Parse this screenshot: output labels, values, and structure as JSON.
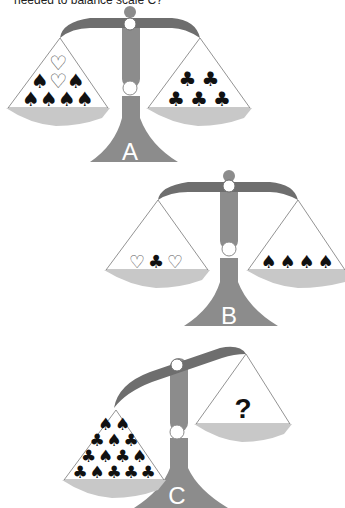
{
  "question": {
    "text": "needed to balance scale C?"
  },
  "colors": {
    "beam": "#6e6e6e",
    "column": "#8c8c8c",
    "pan": "#c8c8c8",
    "pivot": "#ffffff",
    "suit_dark": "#111111",
    "heart_outline": "#555555"
  },
  "scales": [
    {
      "label": "A",
      "left_pan": {
        "rows": [
          [
            "heart"
          ],
          [
            "spade",
            "heart",
            "spade"
          ],
          [
            "spade",
            "spade",
            "spade",
            "spade"
          ]
        ]
      },
      "right_pan": {
        "rows": [
          [
            "club",
            "club"
          ],
          [
            "club",
            "club",
            "club"
          ]
        ]
      }
    },
    {
      "label": "B",
      "left_pan": {
        "rows": [
          [
            "heart",
            "club",
            "heart"
          ]
        ]
      },
      "right_pan": {
        "rows": [
          [
            "spade",
            "spade",
            "spade",
            "spade"
          ]
        ]
      }
    },
    {
      "label": "C",
      "left_pan": {
        "rows": [
          [
            "spade",
            "spade"
          ],
          [
            "club",
            "spade",
            "club"
          ],
          [
            "club",
            "spade",
            "club",
            "spade"
          ],
          [
            "club",
            "spade",
            "club",
            "club",
            "club"
          ]
        ]
      },
      "right_pan": {
        "symbol": "?"
      }
    }
  ],
  "glyphs": {
    "spade": "♠",
    "club": "♣",
    "heart": "♡"
  }
}
